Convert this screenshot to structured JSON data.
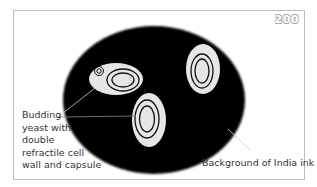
{
  "figure": {
    "badge_number": "200",
    "labels": {
      "yeast_lines": [
        "Budding",
        "yeast with",
        "double",
        "refractile cell",
        "wall and capsule"
      ],
      "ink": "Background of India ink"
    },
    "colors": {
      "ink_background": "#000000",
      "cell_capsule": "#e6e6e6",
      "cell_wall": "#111111",
      "frame_border": "#bdbdbd",
      "leader_line": "#cccccc"
    }
  }
}
